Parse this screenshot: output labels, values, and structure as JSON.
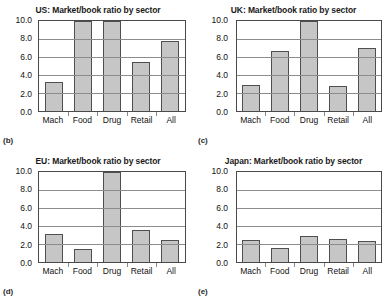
{
  "figure": {
    "panel_letters": [
      "(b)",
      "(c)",
      "(d)",
      "(e)"
    ]
  },
  "chart_data": [
    {
      "type": "bar",
      "title": "US: Market/book ratio by sector",
      "panel_letter": "(b)",
      "categories": [
        "Mach",
        "Food",
        "Drug",
        "Retail",
        "All"
      ],
      "values": [
        3.2,
        10.0,
        9.95,
        5.5,
        7.8
      ],
      "xlabel": "",
      "ylabel": "",
      "ylim": [
        0.0,
        10.0
      ],
      "yticks": [
        0.0,
        2.0,
        4.0,
        6.0,
        8.0,
        10.0
      ],
      "ytick_labels": [
        "0.0",
        "2.0",
        "4.0",
        "6.0",
        "8.0",
        "10.0"
      ],
      "grid": true,
      "legend": false,
      "bar_color": "#c6c6c6",
      "bar_edge_color": "#4f4f4f"
    },
    {
      "type": "bar",
      "title": "UK: Market/book ratio by sector",
      "panel_letter": "(c)",
      "categories": [
        "Mach",
        "Food",
        "Drug",
        "Retail",
        "All"
      ],
      "values": [
        2.9,
        6.7,
        10.0,
        2.8,
        7.0
      ],
      "xlabel": "",
      "ylabel": "",
      "ylim": [
        0.0,
        10.0
      ],
      "yticks": [
        0.0,
        2.0,
        4.0,
        6.0,
        8.0,
        10.0
      ],
      "ytick_labels": [
        "0.0",
        "2.0",
        "4.0",
        "6.0",
        "8.0",
        "10.0"
      ],
      "grid": true,
      "legend": false,
      "bar_color": "#c6c6c6",
      "bar_edge_color": "#4f4f4f"
    },
    {
      "type": "bar",
      "title": "EU: Market/book ratio by sector",
      "panel_letter": "(d)",
      "categories": [
        "Mach",
        "Food",
        "Drug",
        "Retail",
        "All"
      ],
      "values": [
        3.1,
        1.4,
        10.0,
        3.6,
        2.4
      ],
      "xlabel": "",
      "ylabel": "",
      "ylim": [
        0.0,
        10.0
      ],
      "yticks": [
        0.0,
        2.0,
        4.0,
        6.0,
        8.0,
        10.0
      ],
      "ytick_labels": [
        "0.0",
        "2.0",
        "4.0",
        "6.0",
        "8.0",
        "10.0"
      ],
      "grid": true,
      "legend": false,
      "bar_color": "#c6c6c6",
      "bar_edge_color": "#4f4f4f"
    },
    {
      "type": "bar",
      "title": "Japan: Market/book ratio by sector",
      "panel_letter": "(e)",
      "categories": [
        "Mach",
        "Food",
        "Drug",
        "Retail",
        "All"
      ],
      "values": [
        2.4,
        1.6,
        2.85,
        2.6,
        2.35
      ],
      "xlabel": "",
      "ylabel": "",
      "ylim": [
        0.0,
        10.0
      ],
      "yticks": [
        0.0,
        2.0,
        4.0,
        6.0,
        8.0,
        10.0
      ],
      "ytick_labels": [
        "0.0",
        "2.0",
        "4.0",
        "6.0",
        "8.0",
        "10.0"
      ],
      "grid": true,
      "legend": false,
      "bar_color": "#c6c6c6",
      "bar_edge_color": "#4f4f4f"
    }
  ]
}
